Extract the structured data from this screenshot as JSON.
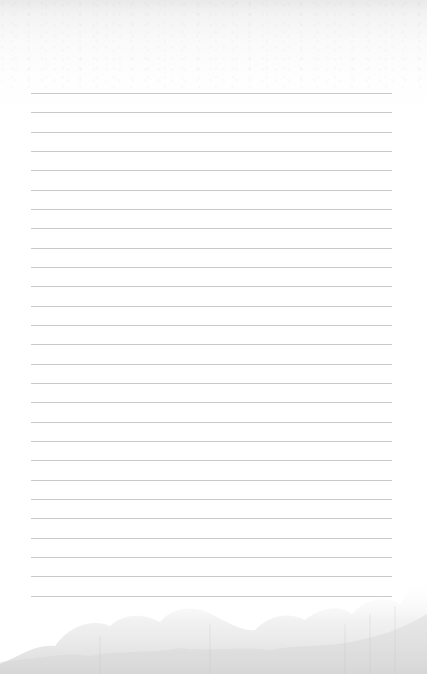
{
  "page": {
    "type": "lined-paper",
    "background_color": "#ffffff",
    "line_color": "#c9c9c9",
    "line_count": 27,
    "first_line_y": 93,
    "line_spacing": 19.33,
    "line_left": 31,
    "line_right": 392,
    "decoration": "faded-tree-silhouette-footer"
  }
}
